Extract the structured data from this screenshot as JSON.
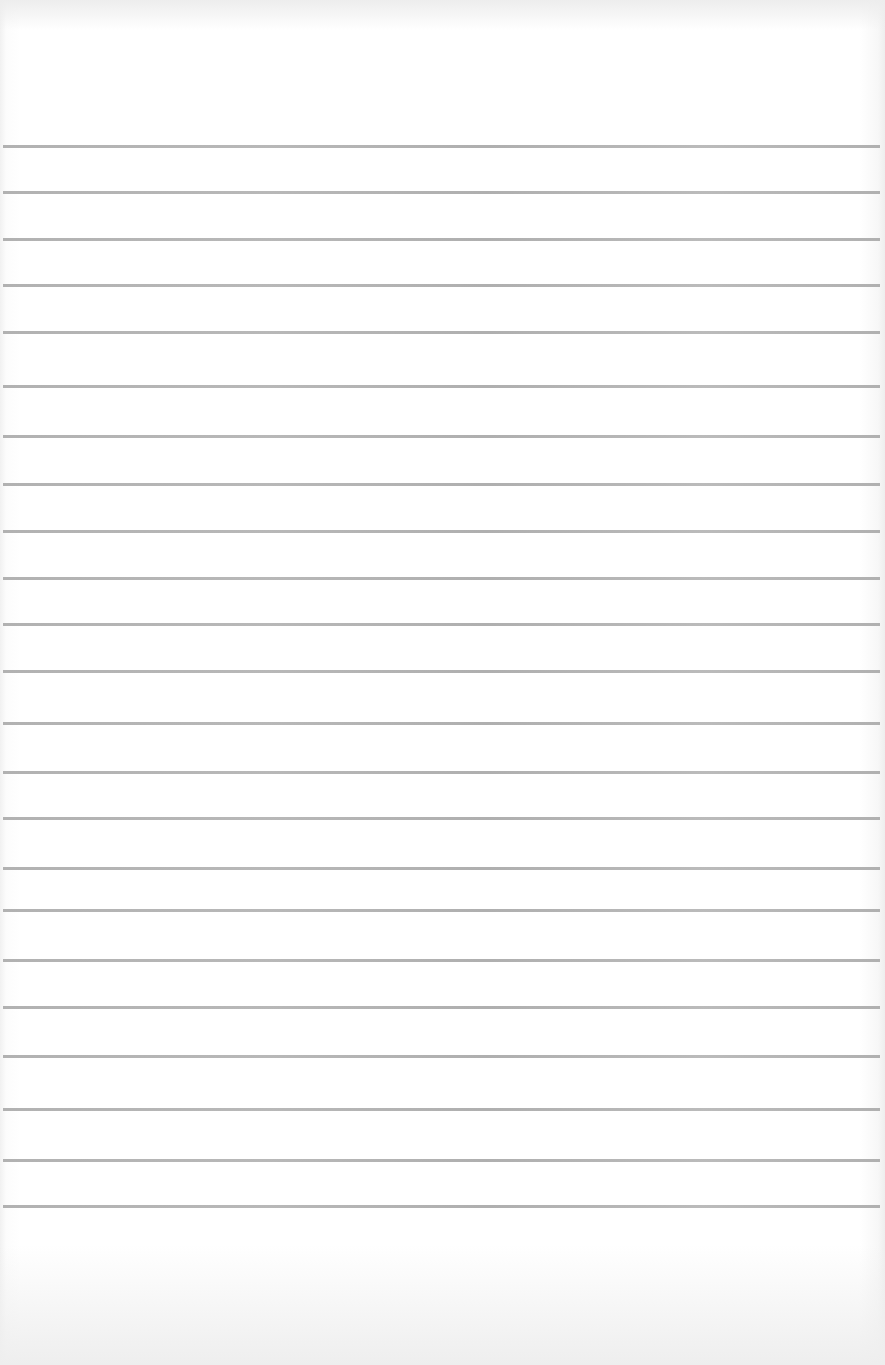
{
  "document": {
    "type": "blank ruled paper",
    "text": "",
    "line_color": "#a9a9a9",
    "paper_color": "#ffffff",
    "rules_y": [
      146,
      192,
      239,
      285,
      332,
      386,
      436,
      484,
      531,
      578,
      624,
      671,
      723,
      772,
      818,
      868,
      910,
      960,
      1007,
      1056,
      1109,
      1160,
      1206
    ]
  }
}
